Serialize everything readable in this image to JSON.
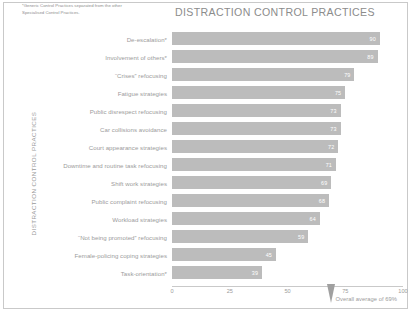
{
  "footnote": "*Generic Control Practices separated from the other Specialised Control Practices.",
  "yaxis_title": "DISTRACTION CONTROL PRACTICES",
  "average_label": "Overall average of 69%",
  "colors": {
    "bar": "#bcbcbc",
    "text": "#9b9b9b",
    "title": "#8c8c8c",
    "value_text": "#ffffff",
    "frame": "#c9c9c9",
    "marker": "#a0a0a0"
  },
  "chart_data": {
    "type": "bar",
    "orientation": "horizontal",
    "title": "DISTRACTION CONTROL PRACTICES",
    "xlabel": "",
    "ylabel": "DISTRACTION CONTROL PRACTICES",
    "xlim": [
      0,
      100
    ],
    "xticks": [
      0,
      25,
      50,
      75,
      100
    ],
    "grid": false,
    "legend": false,
    "average": 69,
    "average_annotation": "Overall average of 69%",
    "categories": [
      "De-escalation*",
      "Involvement of others*",
      "“Crises” refocusing",
      "Fatigue strategies",
      "Public disrespect refocusing",
      "Car collisions avoidance",
      "Court appearance strategies",
      "Downtime and routine task refocusing",
      "Shift work strategies",
      "Public complaint refocusing",
      "Workload strategies",
      "“Not being promoted” refocusing",
      "Female-policing coping strategies",
      "Task-orientation*"
    ],
    "values": [
      90,
      89,
      79,
      75,
      73,
      73,
      72,
      71,
      69,
      68,
      64,
      59,
      45,
      39
    ]
  }
}
